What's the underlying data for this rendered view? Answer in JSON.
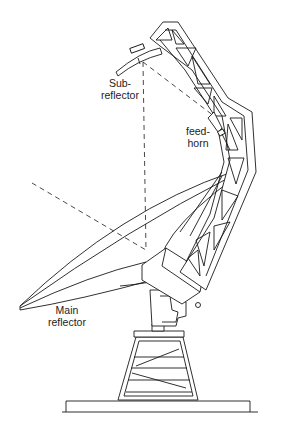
{
  "diagram": {
    "colors": {
      "line": "#1a1a1a",
      "background": "#ffffff",
      "text": "#222222"
    },
    "labels": {
      "subreflector": {
        "line1": "Sub-",
        "line2": "reflector"
      },
      "feedhorn": {
        "line1": "feed-",
        "line2": "horn"
      },
      "main_reflector": {
        "line1": "Main",
        "line2": "reflector"
      }
    }
  }
}
